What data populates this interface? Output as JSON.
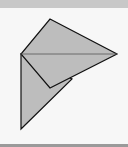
{
  "diagram": {
    "fill_color": "#bdbdbd",
    "stroke_color": "#111111",
    "background_color": "#f7f7f7",
    "header_color": "#c8c8c8",
    "shapes": [
      {
        "name": "kite",
        "points": "50,19 117,54 50,88 21,54"
      },
      {
        "name": "lower-triangle",
        "points": "21,54 72,79 21,129"
      }
    ],
    "lines": [
      {
        "name": "horizontal-diagonal",
        "x1": 21,
        "y1": 54,
        "x2": 117,
        "y2": 54
      }
    ]
  }
}
